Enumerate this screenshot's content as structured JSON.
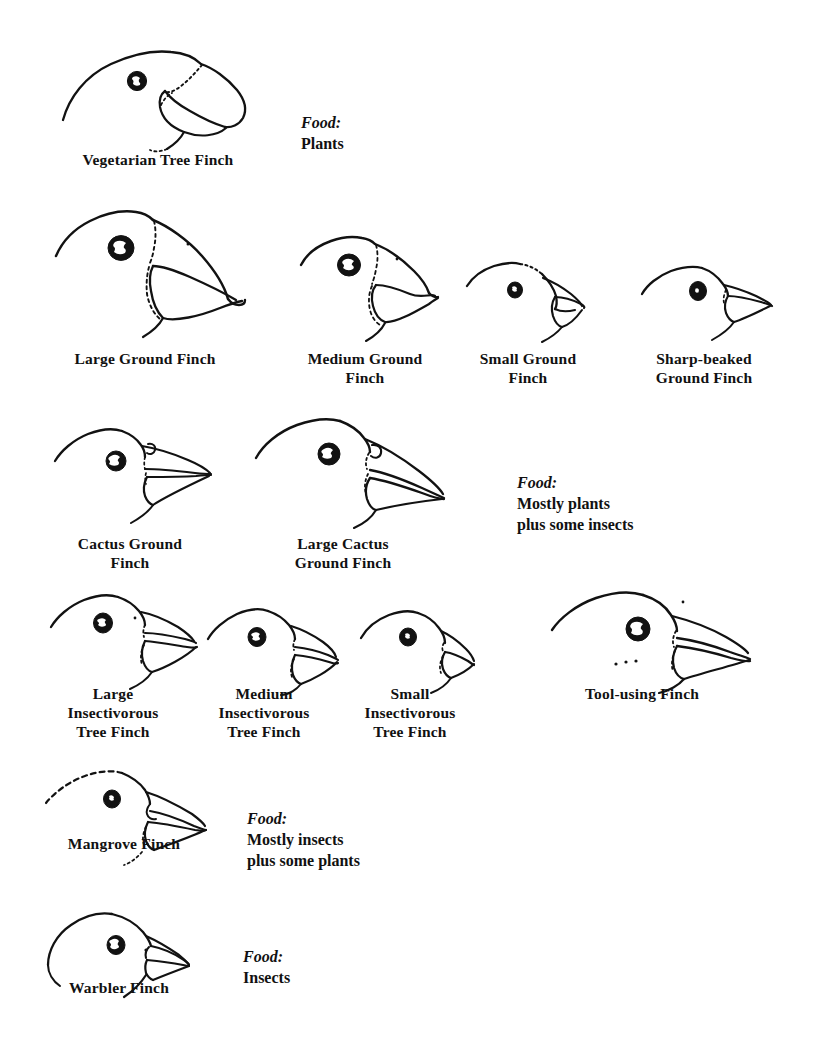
{
  "figure": {
    "ink_color": "#121212",
    "background_color": "#ffffff"
  },
  "species": [
    {
      "id": "vegetarian-tree-finch",
      "label": "Vegetarian Tree Finch",
      "label_x": 158,
      "label_y": 150
    },
    {
      "id": "large-ground-finch",
      "label": "Large Ground Finch",
      "label_x": 145,
      "label_y": 349
    },
    {
      "id": "medium-ground-finch",
      "label": "Medium Ground\nFinch",
      "label_x": 365,
      "label_y": 349
    },
    {
      "id": "small-ground-finch",
      "label": "Small Ground\nFinch",
      "label_x": 528,
      "label_y": 349
    },
    {
      "id": "sharp-beaked-ground-finch",
      "label": "Sharp-beaked\nGround Finch",
      "label_x": 704,
      "label_y": 349
    },
    {
      "id": "cactus-ground-finch",
      "label": "Cactus Ground\nFinch",
      "label_x": 130,
      "label_y": 534
    },
    {
      "id": "large-cactus-ground-finch",
      "label": "Large Cactus\nGround Finch",
      "label_x": 343,
      "label_y": 534
    },
    {
      "id": "large-insectivorous-tree-finch",
      "label": "Large\nInsectivorous\nTree Finch",
      "label_x": 113,
      "label_y": 684
    },
    {
      "id": "medium-insectivorous-tree-finch",
      "label": "Medium\nInsectivorous\nTree Finch",
      "label_x": 264,
      "label_y": 684
    },
    {
      "id": "small-insectivorous-tree-finch",
      "label": "Small\nInsectivorous\nTree Finch",
      "label_x": 410,
      "label_y": 684
    },
    {
      "id": "tool-using-finch",
      "label": "Tool-using Finch",
      "label_x": 642,
      "label_y": 684
    },
    {
      "id": "mangrove-finch",
      "label": "Mangrove Finch",
      "label_x": 124,
      "label_y": 834
    },
    {
      "id": "warbler-finch",
      "label": "Warbler Finch",
      "label_x": 119,
      "label_y": 978
    }
  ],
  "food_notes": [
    {
      "id": "food-plants",
      "prefix": "Food:",
      "value": "Plants",
      "x": 301,
      "y": 91
    },
    {
      "id": "food-mostly-plants",
      "prefix": "Food:",
      "value": "Mostly plants\nplus some insects",
      "x": 517,
      "y": 451
    },
    {
      "id": "food-mostly-insects",
      "prefix": "Food:",
      "value": "Mostly insects\nplus some plants",
      "x": 247,
      "y": 787
    },
    {
      "id": "food-insects",
      "prefix": "Food:",
      "value": "Insects",
      "x": 243,
      "y": 925
    }
  ]
}
